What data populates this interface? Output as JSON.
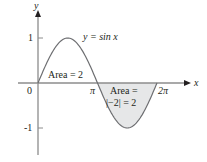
{
  "chart_data": {
    "type": "area",
    "title": "",
    "function_label": "y = sin x",
    "xlabel": "x",
    "ylabel": "y",
    "xlim": [
      0,
      6.2832
    ],
    "ylim": [
      -1,
      1
    ],
    "grid": false,
    "legend": null,
    "x_ticks": [
      {
        "value": 0,
        "label": "0"
      },
      {
        "value": 3.1416,
        "label": "π"
      },
      {
        "value": 6.2832,
        "label": "2π"
      }
    ],
    "y_ticks": [
      {
        "value": 1,
        "label": "1"
      },
      {
        "value": -1,
        "label": "-1"
      }
    ],
    "series": [
      {
        "name": "y = sin x",
        "x": [
          0,
          0.7854,
          1.5708,
          2.3562,
          3.1416,
          3.927,
          4.7124,
          5.4978,
          6.2832
        ],
        "values": [
          0,
          0.707,
          1,
          0.707,
          0,
          -0.707,
          -1,
          -0.707,
          0
        ]
      }
    ],
    "shaded_regions": [
      {
        "from": 0,
        "to": 3.1416,
        "label": "Area = 2",
        "fill": "none"
      },
      {
        "from": 3.1416,
        "to": 6.2832,
        "label_line1": "Area =",
        "label_line2": "|−2| = 2",
        "fill": "#e6e7e8"
      }
    ],
    "annotations": [
      "Area = 2",
      "Area =",
      "|−2| = 2"
    ]
  },
  "colors": {
    "axis": "#8c8c8c",
    "curve": "#6d6e71",
    "shade": "#e6e7e8",
    "text": "#231f20"
  }
}
